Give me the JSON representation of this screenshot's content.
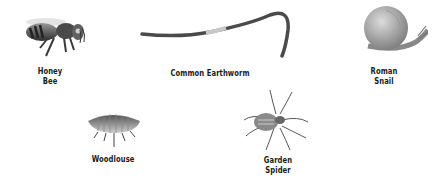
{
  "creatures": [
    {
      "id": "honey-bee",
      "line1": "Honey",
      "line2": "Bee"
    },
    {
      "id": "common-earthworm",
      "line1": "Common Earthworm"
    },
    {
      "id": "roman-snail",
      "line1": "Roman",
      "line2": "Snail"
    },
    {
      "id": "woodlouse",
      "line1": "Woodlouse"
    },
    {
      "id": "garden-spider",
      "line1": "Garden",
      "line2": "Spider"
    }
  ],
  "colors": {
    "background": "#ffffff",
    "label": "#1a1a1a",
    "illustration": "#555555"
  }
}
